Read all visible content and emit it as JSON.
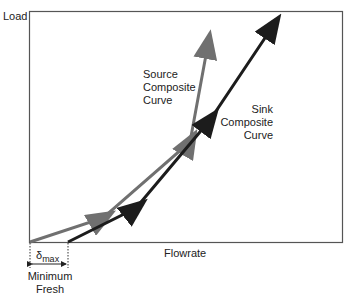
{
  "axes": {
    "y_label": "Load",
    "x_label": "Flowrate"
  },
  "curves": {
    "source": {
      "label": [
        "Source",
        "Composite",
        "Curve"
      ],
      "color": "#707070",
      "points": [
        [
          30,
          242
        ],
        [
          103,
          218
        ],
        [
          190,
          142
        ],
        [
          208,
          44
        ]
      ]
    },
    "sink": {
      "label": [
        "Sink",
        "Composite",
        "Curve"
      ],
      "color": "#1c1c1c",
      "points": [
        [
          68,
          242
        ],
        [
          136,
          208
        ],
        [
          210,
          120
        ],
        [
          273,
          26
        ]
      ]
    }
  },
  "annotation": {
    "delta": "δ",
    "delta_sub": "max",
    "text": [
      "Minimum",
      "Fresh"
    ]
  }
}
